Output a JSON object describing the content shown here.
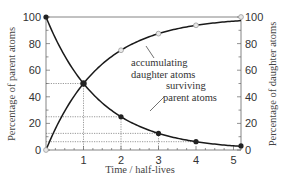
{
  "chart_data": {
    "type": "line",
    "title": "",
    "xlabel": "Time / half-lives",
    "ylabel_left": "Percentage of parent atoms",
    "ylabel_right": "Percentage of daughter atoms",
    "xlim": [
      0,
      5.2
    ],
    "ylim": [
      0,
      100
    ],
    "x_ticks": [
      1,
      2,
      3,
      4,
      5
    ],
    "y_ticks": [
      0,
      20,
      40,
      60,
      80,
      100
    ],
    "grid": false,
    "series": [
      {
        "name": "surviving parent atoms",
        "marker": "filled-circle",
        "x": [
          0,
          1,
          2,
          3,
          4,
          5.2
        ],
        "values": [
          100,
          50,
          25,
          12.5,
          6.25,
          3.1
        ]
      },
      {
        "name": "accumulating daughter atoms",
        "marker": "open-circle",
        "x": [
          0,
          1,
          2,
          3,
          4,
          5.2
        ],
        "values": [
          0,
          50,
          75,
          87.5,
          93.75,
          100
        ]
      }
    ],
    "guide_lines": [
      {
        "x": 1,
        "y": 50
      },
      {
        "x": 2,
        "y": 25
      },
      {
        "x": 3,
        "y": 12.5
      },
      {
        "x": 4,
        "y": 6.25
      }
    ],
    "annotations": [
      {
        "text_lines": [
          "accumulating",
          "daughter atoms"
        ],
        "points_to": "daughter curve"
      },
      {
        "text_lines": [
          "surviving",
          "parent atoms"
        ],
        "points_to": "parent curve"
      }
    ]
  }
}
